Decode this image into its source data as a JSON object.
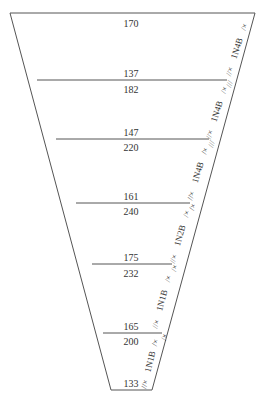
{
  "diagram": {
    "type": "tapered-funnel-sections",
    "line_color": "#555555",
    "text_color": "#333333",
    "outline": {
      "top_left": [
        10,
        13
      ],
      "top_right": [
        255,
        13
      ],
      "bottom_left": [
        111,
        390
      ],
      "bottom_right": [
        152,
        390
      ]
    },
    "sections": [
      {
        "top_value": "170",
        "bottom_value": "137",
        "label": "1N4B",
        "marks_top": "/×",
        "marks_bottom": "//×"
      },
      {
        "top_value": "182",
        "bottom_value": "147",
        "label": "1N4B",
        "marks_top": "/×",
        "marks_bottom": "//×"
      },
      {
        "top_value": "220",
        "bottom_value": "161",
        "label": "1N4B",
        "marks_top": "/×",
        "marks_bottom": "//×"
      },
      {
        "top_value": "240",
        "bottom_value": "175",
        "label": "1N2B",
        "marks_top": "/×",
        "marks_bottom": "//×"
      },
      {
        "top_value": "232",
        "bottom_value": "165",
        "label": "1N1B",
        "marks_top": "/×",
        "marks_bottom": "//×"
      },
      {
        "top_value": "200",
        "bottom_value": "133",
        "label": "1N1B",
        "marks_top": "/×",
        "marks_bottom": "//×"
      }
    ],
    "joint_marks": [
      "///",
      "///",
      "/×",
      "/×",
      "/×"
    ]
  }
}
